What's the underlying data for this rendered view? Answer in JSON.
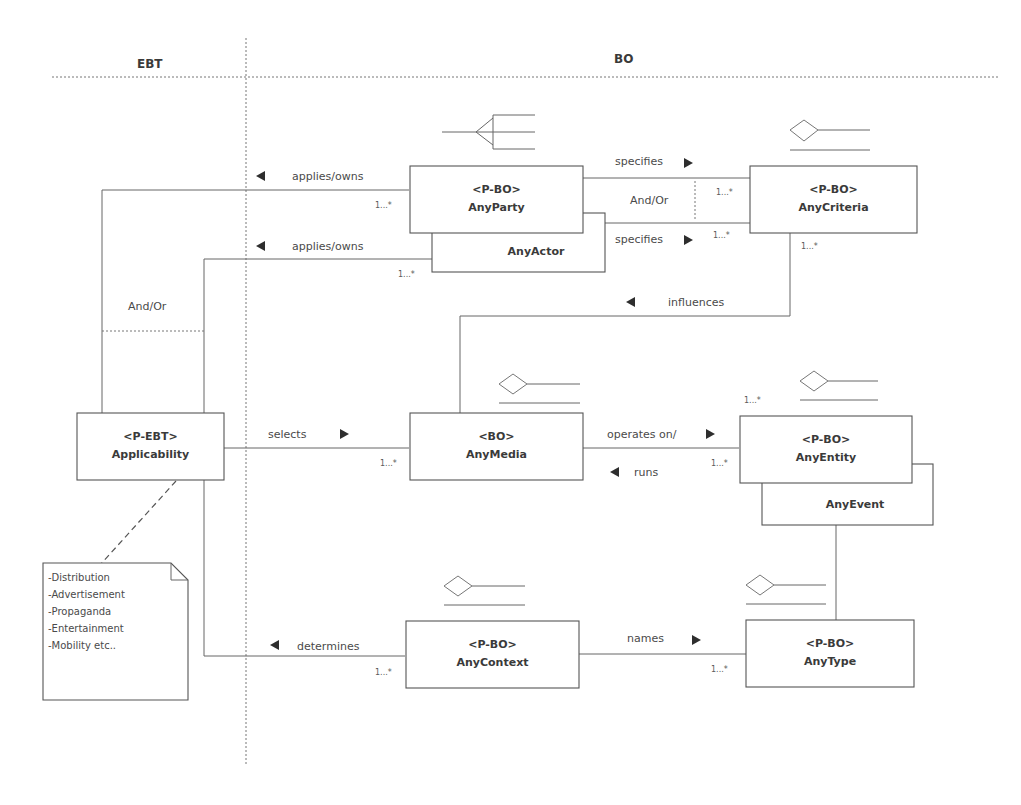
{
  "lanes": {
    "left": "EBT",
    "right": "BO"
  },
  "classes": {
    "applicability": {
      "stereotype": "<P-EBT>",
      "name": "Applicability"
    },
    "any_party": {
      "stereotype": "<P-BO>",
      "name": "AnyParty"
    },
    "any_actor": {
      "name": "AnyActor"
    },
    "any_criteria": {
      "stereotype": "<P-BO>",
      "name": "AnyCriteria"
    },
    "any_media": {
      "stereotype": "<BO>",
      "name": "AnyMedia"
    },
    "any_entity": {
      "stereotype": "<P-BO>",
      "name": "AnyEntity"
    },
    "any_event": {
      "name": "AnyEvent"
    },
    "any_context": {
      "stereotype": "<P-BO>",
      "name": "AnyContext"
    },
    "any_type": {
      "stereotype": "<P-BO>",
      "name": "AnyType"
    }
  },
  "associations": {
    "applies_owns_1": "applies/owns",
    "applies_owns_2": "applies/owns",
    "and_or_left": "And/Or",
    "specifies_1": "specifies",
    "specifies_2": "specifies",
    "and_or_right": "And/Or",
    "influences": "influences",
    "selects": "selects",
    "operates_on": "operates on/",
    "runs": "runs",
    "determines": "determines",
    "names": "names"
  },
  "multiplicities": {
    "party_applies": "1...*",
    "actor_applies": "1...*",
    "criteria_specifies_1": "1...*",
    "criteria_specifies_2": "1...*",
    "criteria_influences": "1...*",
    "media_selects": "1...*",
    "entity_top": "1...*",
    "entity_operates": "1...*",
    "context_determines": "1...*",
    "type_names": "1...*"
  },
  "note": {
    "lines": [
      "-Distribution",
      "-Advertisement",
      "-Propaganda",
      "-Entertainment",
      "-Mobility etc.."
    ]
  }
}
